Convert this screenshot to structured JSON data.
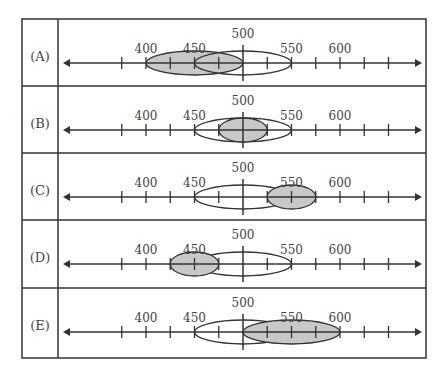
{
  "colors": {
    "line": "#333333",
    "fill_gray": "#c8c8c8",
    "fill_white": "#ffffff",
    "text": "#444444"
  },
  "axis": {
    "ticks": [
      375,
      400,
      425,
      450,
      475,
      525,
      550,
      575,
      600,
      625,
      650
    ],
    "center": 500,
    "labels": [
      {
        "value": 400,
        "text": "400"
      },
      {
        "value": 450,
        "text": "450"
      },
      {
        "value": 500,
        "text": "500"
      },
      {
        "value": 550,
        "text": "550"
      },
      {
        "value": 600,
        "text": "600"
      }
    ]
  },
  "rows": [
    {
      "option": "(A)",
      "white": [
        450,
        550
      ],
      "gray": [
        400,
        500
      ],
      "gray_on_top": false
    },
    {
      "option": "(B)",
      "white": [
        450,
        550
      ],
      "gray": [
        475,
        525
      ],
      "gray_on_top": true
    },
    {
      "option": "(C)",
      "white": [
        450,
        550
      ],
      "gray": [
        525,
        575
      ],
      "gray_on_top": true
    },
    {
      "option": "(D)",
      "white": [
        450,
        550
      ],
      "gray": [
        425,
        475
      ],
      "gray_on_top": true
    },
    {
      "option": "(E)",
      "white": [
        450,
        550
      ],
      "gray": [
        500,
        600
      ],
      "gray_on_top": true
    }
  ]
}
